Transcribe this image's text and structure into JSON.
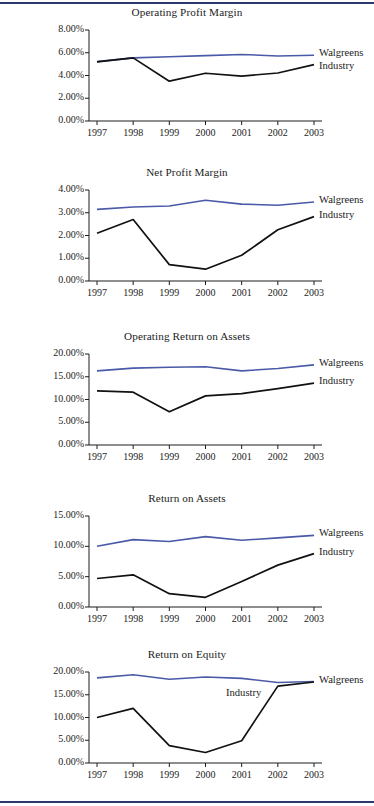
{
  "page": {
    "rule_color": "#2b3a6b",
    "background": "#ffffff"
  },
  "colors": {
    "walgreens": "#4a5aa8",
    "industry": "#111111",
    "axis": "#1c1c1c"
  },
  "series_labels": {
    "walgreens": "Walgreens",
    "industry": "Industry"
  },
  "chart_data": [
    {
      "type": "line",
      "title": "Operating Profit Margin",
      "xlabel": "",
      "ylabel": "",
      "x": [
        "1997",
        "1998",
        "1999",
        "2000",
        "2001",
        "2002",
        "2003"
      ],
      "ylim": [
        0,
        8
      ],
      "yticks": [
        0,
        2,
        4,
        6,
        8
      ],
      "ytick_labels": [
        "0.00%",
        "2.00%",
        "4.00%",
        "6.00%",
        "8.00%"
      ],
      "grid": false,
      "legend_position": "right-inline",
      "series": [
        {
          "name": "Walgreens",
          "values": [
            5.22,
            5.55,
            5.65,
            5.75,
            5.85,
            5.72,
            5.78
          ]
        },
        {
          "name": "Industry",
          "values": [
            5.2,
            5.55,
            3.5,
            4.2,
            3.95,
            4.22,
            4.95
          ]
        }
      ]
    },
    {
      "type": "line",
      "title": "Net Profit Margin",
      "xlabel": "",
      "ylabel": "",
      "x": [
        "1997",
        "1998",
        "1999",
        "2000",
        "2001",
        "2002",
        "2003"
      ],
      "ylim": [
        0,
        4
      ],
      "yticks": [
        0,
        1,
        2,
        3,
        4
      ],
      "ytick_labels": [
        "0.00%",
        "1.00%",
        "2.00%",
        "3.00%",
        "4.00%"
      ],
      "grid": false,
      "legend_position": "right-inline",
      "series": [
        {
          "name": "Walgreens",
          "values": [
            3.15,
            3.25,
            3.3,
            3.55,
            3.38,
            3.33,
            3.47
          ]
        },
        {
          "name": "Industry",
          "values": [
            2.1,
            2.7,
            0.72,
            0.52,
            1.13,
            2.25,
            2.83
          ]
        }
      ]
    },
    {
      "type": "line",
      "title": "Operating Return on Assets",
      "xlabel": "",
      "ylabel": "",
      "x": [
        "1997",
        "1998",
        "1999",
        "2000",
        "2001",
        "2002",
        "2003"
      ],
      "ylim": [
        0,
        20
      ],
      "yticks": [
        0,
        5,
        10,
        15,
        20
      ],
      "ytick_labels": [
        "0.00%",
        "5.00%",
        "10.00%",
        "15.00%",
        "20.00%"
      ],
      "grid": false,
      "legend_position": "right-inline",
      "series": [
        {
          "name": "Walgreens",
          "values": [
            16.3,
            16.9,
            17.1,
            17.2,
            16.3,
            16.8,
            17.6
          ]
        },
        {
          "name": "Industry",
          "values": [
            11.9,
            11.6,
            7.3,
            10.8,
            11.3,
            12.4,
            13.6
          ]
        }
      ]
    },
    {
      "type": "line",
      "title": "Return on Assets",
      "xlabel": "",
      "ylabel": "",
      "x": [
        "1997",
        "1998",
        "1999",
        "2000",
        "2001",
        "2002",
        "2003"
      ],
      "ylim": [
        0,
        15
      ],
      "yticks": [
        0,
        5,
        10,
        15
      ],
      "ytick_labels": [
        "0.00%",
        "5.00%",
        "10.00%",
        "15.00%"
      ],
      "grid": false,
      "legend_position": "right-inline",
      "series": [
        {
          "name": "Walgreens",
          "values": [
            10.0,
            11.1,
            10.8,
            11.6,
            11.0,
            11.4,
            11.8
          ]
        },
        {
          "name": "Industry",
          "values": [
            4.7,
            5.3,
            2.2,
            1.6,
            4.2,
            6.9,
            8.8
          ]
        }
      ]
    },
    {
      "type": "line",
      "title": "Return on Equity",
      "xlabel": "",
      "ylabel": "",
      "x": [
        "1997",
        "1998",
        "1999",
        "2000",
        "2001",
        "2002",
        "2003"
      ],
      "ylim": [
        0,
        20
      ],
      "yticks": [
        0,
        5,
        10,
        15,
        20
      ],
      "ytick_labels": [
        "0.00%",
        "5.00%",
        "10.00%",
        "15.00%",
        "20.00%"
      ],
      "grid": false,
      "legend_position": "right-inline",
      "series": [
        {
          "name": "Walgreens",
          "values": [
            18.7,
            19.4,
            18.4,
            18.9,
            18.6,
            17.7,
            17.9
          ]
        },
        {
          "name": "Industry",
          "values": [
            10.0,
            12.0,
            3.8,
            2.3,
            4.9,
            16.9,
            17.8
          ]
        }
      ]
    }
  ]
}
